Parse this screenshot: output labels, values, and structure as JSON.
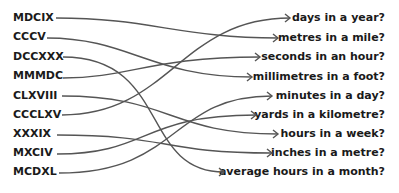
{
  "left_items": [
    {
      "label": "MDCIX",
      "y": 18
    },
    {
      "label": "CCCV",
      "y": 37
    },
    {
      "label": "DCCXXX",
      "y": 57
    },
    {
      "label": "MMMDC",
      "y": 76
    },
    {
      "label": "CLXVIII",
      "y": 96
    },
    {
      "label": "CCCLXV",
      "y": 115
    },
    {
      "label": "XXXIX",
      "y": 134
    },
    {
      "label": "MXCIV",
      "y": 153
    },
    {
      "label": "MCDXL",
      "y": 172
    }
  ],
  "right_items": [
    {
      "label": "days in a year?",
      "y": 18
    },
    {
      "label": "metres in a mile?",
      "y": 38
    },
    {
      "label": "seconds in an hour?",
      "y": 57
    },
    {
      "label": "millimetres in a foot?",
      "y": 77
    },
    {
      "label": "minutes in a day?",
      "y": 96
    },
    {
      "label": "yards in a kilometre?",
      "y": 115
    },
    {
      "label": "hours in a week?",
      "y": 134
    },
    {
      "label": "inches in a metre?",
      "y": 153
    },
    {
      "label": "average hours in a month?",
      "y": 172
    }
  ],
  "connections": [
    {
      "from": "MDCIX",
      "to": "metres in a mile?"
    },
    {
      "from": "CCCV",
      "to": "millimetres in a foot?"
    },
    {
      "from": "DCCXXX",
      "to": "average hours in a month?"
    },
    {
      "from": "MMMDC",
      "to": "seconds in an hour?"
    },
    {
      "from": "CLXVIII",
      "to": "hours in a week?"
    },
    {
      "from": "CCCLXV",
      "to": "days in a year?"
    },
    {
      "from": "XXXIX",
      "to": "inches in a metre?"
    },
    {
      "from": "MXCIV",
      "to": "yards in a kilometre?"
    },
    {
      "from": "MCDXL",
      "to": "minutes in a day?"
    }
  ]
}
